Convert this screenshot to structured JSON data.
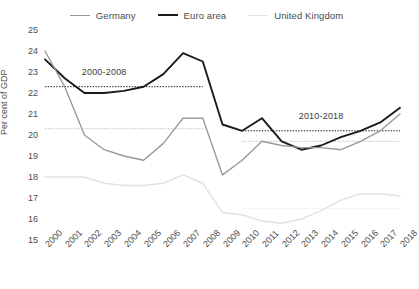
{
  "chart_data": {
    "type": "line",
    "title": "",
    "xlabel": "",
    "ylabel": "Per cent of GDP",
    "x": [
      "2000",
      "2001",
      "2002",
      "2003",
      "2004",
      "2005",
      "2006",
      "2007",
      "2008",
      "2009",
      "2010",
      "2011",
      "2012",
      "2013",
      "2014",
      "2015",
      "2016",
      "2017",
      "2018"
    ],
    "xlim": [
      2000,
      2018
    ],
    "ylim": [
      15,
      25
    ],
    "yticks": [
      "25",
      "24",
      "23",
      "22",
      "21",
      "20",
      "19",
      "18",
      "17",
      "16",
      "15"
    ],
    "grid": false,
    "legend_position": "top-center",
    "series": [
      {
        "name": "Germany",
        "color": "#9a9a9a",
        "width": 1.4,
        "values": [
          24.0,
          22.3,
          20.0,
          19.3,
          19.0,
          18.8,
          19.6,
          20.8,
          20.8,
          18.1,
          18.8,
          19.7,
          19.5,
          19.4,
          19.4,
          19.3,
          19.7,
          20.2,
          21.0
        ]
      },
      {
        "name": "Euro area",
        "color": "#1a1a1a",
        "width": 1.9,
        "values": [
          23.6,
          22.7,
          22.0,
          22.0,
          22.1,
          22.3,
          22.9,
          23.9,
          23.5,
          20.5,
          20.2,
          20.8,
          19.7,
          19.3,
          19.5,
          19.9,
          20.2,
          20.6,
          21.3
        ]
      },
      {
        "name": "United Kingdom",
        "color": "#e2e2e2",
        "width": 1.5,
        "values": [
          18.0,
          18.0,
          18.0,
          17.7,
          17.6,
          17.6,
          17.7,
          18.1,
          17.7,
          16.3,
          16.2,
          15.9,
          15.8,
          16.0,
          16.4,
          16.9,
          17.2,
          17.2,
          17.1
        ]
      }
    ],
    "reference_lines": [
      {
        "label": "2000-2008",
        "series": "Euro area",
        "value": 22.3,
        "x_start": "2000",
        "x_end": "2008",
        "color": "#1a1a1a"
      },
      {
        "label": "2000-2008",
        "series": "Germany",
        "value": 20.3,
        "x_start": "2000",
        "x_end": "2008",
        "color": "#bdbdbd"
      },
      {
        "label": "2010-2018",
        "series": "Euro area",
        "value": 20.2,
        "x_start": "2010",
        "x_end": "2018",
        "color": "#1a1a1a"
      },
      {
        "label": "2010-2018",
        "series": "Germany",
        "value": 19.7,
        "x_start": "2010",
        "x_end": "2018",
        "color": "#bdbdbd"
      },
      {
        "label": "2010-2018",
        "series": "United Kingdom",
        "value": 16.5,
        "x_start": "2010",
        "x_end": "2018",
        "color": "#ededed"
      }
    ],
    "annotations": [
      {
        "text": "2000-2008",
        "x": "2003",
        "y": 23.0
      },
      {
        "text": "2010-2018",
        "x": "2014",
        "y": 20.9
      }
    ]
  },
  "legend": {
    "items": [
      {
        "label": "Germany"
      },
      {
        "label": "Euro area"
      },
      {
        "label": "United Kingdom"
      }
    ]
  }
}
